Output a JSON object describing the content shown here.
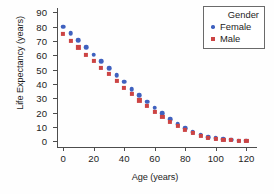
{
  "chart_data": {
    "type": "scatter",
    "title": "",
    "xlabel": "Age (years)",
    "ylabel": "Life Expectancy (years)",
    "xlim": [
      -4,
      127
    ],
    "ylim": [
      -4,
      93
    ],
    "xticks": [
      0,
      20,
      40,
      60,
      80,
      100,
      120
    ],
    "yticks": [
      0,
      10,
      20,
      30,
      40,
      50,
      60,
      70,
      80,
      90
    ],
    "grid": false,
    "legend_position": "top-right",
    "legend_title": "Gender",
    "x": [
      0,
      5,
      10,
      15,
      20,
      25,
      30,
      35,
      40,
      45,
      50,
      55,
      60,
      65,
      70,
      75,
      80,
      85,
      90,
      95,
      100,
      105,
      110,
      115,
      120
    ],
    "series": [
      {
        "name": "Female",
        "marker": "circle",
        "color": "#3f61bf",
        "values": [
          80,
          75.5,
          70.5,
          65.5,
          60.5,
          56,
          51,
          46,
          41.5,
          36.5,
          32,
          27.5,
          23.5,
          19.5,
          15.5,
          12,
          9,
          6.5,
          4.5,
          3,
          2,
          1.5,
          1,
          0.5,
          0.5
        ]
      },
      {
        "name": "Male",
        "marker": "square",
        "color": "#cc4444",
        "values": [
          75,
          70,
          65.5,
          60.5,
          56,
          51,
          47,
          42,
          37,
          33,
          28.5,
          24.5,
          20.5,
          17,
          13.5,
          10.5,
          8,
          6,
          4,
          2.5,
          1.8,
          1.2,
          0.8,
          0.5,
          0.5
        ]
      }
    ]
  },
  "legend": {
    "title": "Gender",
    "entries": [
      {
        "label": "Female",
        "color": "#3f61bf",
        "marker": "circle-icon"
      },
      {
        "label": "Male",
        "color": "#cc4444",
        "marker": "square-icon"
      }
    ]
  }
}
